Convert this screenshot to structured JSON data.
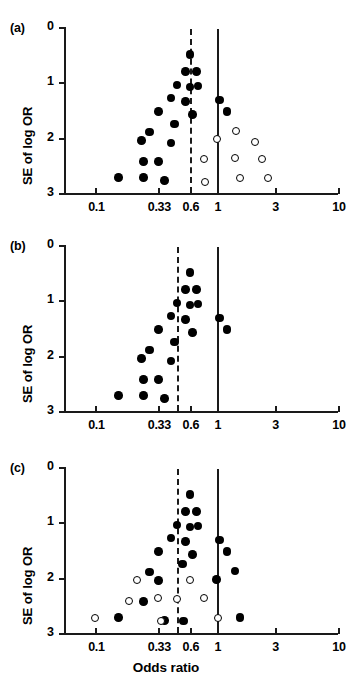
{
  "figure": {
    "xlabel": "Odds ratio",
    "ylabel": "SE of log OR"
  },
  "panels": [
    {
      "letter": "(a)",
      "ylabel": "SE of log OR",
      "xticks": [
        "0.1",
        "0.33",
        "0.6",
        "1",
        "3",
        "10"
      ],
      "yticks": [
        "0",
        "1",
        "2",
        "3"
      ],
      "pooled_line_value": "0.6",
      "null_line_value": "1"
    },
    {
      "letter": "(b)",
      "ylabel": "SE of log OR",
      "xticks": [
        "0.1",
        "0.33",
        "0.6",
        "1",
        "3",
        "10"
      ],
      "yticks": [
        "0",
        "1",
        "2",
        "3"
      ],
      "pooled_line_value": "0.47",
      "null_line_value": "1"
    },
    {
      "letter": "(c)",
      "ylabel": "SE of log OR",
      "xticks": [
        "0.1",
        "0.33",
        "0.6",
        "1",
        "3",
        "10"
      ],
      "yticks": [
        "0",
        "1",
        "2",
        "3"
      ],
      "pooled_line_value": "0.47",
      "null_line_value": "1"
    }
  ],
  "chart_data": [
    {
      "type": "scatter",
      "panel": "(a)",
      "title": "(a)",
      "xlabel": "",
      "ylabel": "SE of log OR",
      "xscale": "log",
      "xlim": [
        0.055,
        10
      ],
      "ylim": [
        0,
        3
      ],
      "y_inverted": true,
      "xticks": [
        0.1,
        0.33,
        0.6,
        1,
        3,
        10
      ],
      "xticklabels": [
        "0.1",
        "0.33",
        "0.6",
        "1",
        "3",
        "10"
      ],
      "yticks": [
        0,
        1,
        2,
        3
      ],
      "yticklabels": [
        "0",
        "1",
        "2",
        "3"
      ],
      "grid": false,
      "legend": null,
      "reference_lines": [
        {
          "name": "pooled-estimate",
          "x": 0.6,
          "style": "dashed"
        },
        {
          "name": "null-effect",
          "x": 1.0,
          "style": "solid"
        }
      ],
      "series": [
        {
          "name": "observed-studies",
          "marker": "filled-circle",
          "color": "#000000",
          "points": [
            {
              "x": 0.6,
              "y": 0.5
            },
            {
              "x": 0.55,
              "y": 0.8
            },
            {
              "x": 0.68,
              "y": 0.8
            },
            {
              "x": 0.47,
              "y": 1.05
            },
            {
              "x": 0.6,
              "y": 1.08
            },
            {
              "x": 0.7,
              "y": 1.07
            },
            {
              "x": 0.42,
              "y": 1.28
            },
            {
              "x": 0.55,
              "y": 1.35
            },
            {
              "x": 1.05,
              "y": 1.32
            },
            {
              "x": 0.33,
              "y": 1.53
            },
            {
              "x": 0.63,
              "y": 1.58
            },
            {
              "x": 1.22,
              "y": 1.53
            },
            {
              "x": 0.28,
              "y": 1.9
            },
            {
              "x": 0.45,
              "y": 1.75
            },
            {
              "x": 0.24,
              "y": 2.05
            },
            {
              "x": 0.42,
              "y": 2.1
            },
            {
              "x": 0.25,
              "y": 2.43
            },
            {
              "x": 0.33,
              "y": 2.43
            },
            {
              "x": 0.155,
              "y": 2.72
            },
            {
              "x": 0.25,
              "y": 2.72
            },
            {
              "x": 0.37,
              "y": 2.77
            }
          ]
        },
        {
          "name": "imputed-studies",
          "marker": "open-circle",
          "color": "#000000",
          "points": [
            {
              "x": 1.45,
              "y": 1.88
            },
            {
              "x": 1.0,
              "y": 2.03
            },
            {
              "x": 2.05,
              "y": 2.07
            },
            {
              "x": 1.42,
              "y": 2.37
            },
            {
              "x": 2.35,
              "y": 2.38
            },
            {
              "x": 0.78,
              "y": 2.38
            },
            {
              "x": 1.55,
              "y": 2.72
            },
            {
              "x": 2.65,
              "y": 2.72
            },
            {
              "x": 0.8,
              "y": 2.8
            }
          ]
        }
      ]
    },
    {
      "type": "scatter",
      "panel": "(b)",
      "title": "(b)",
      "xlabel": "",
      "ylabel": "SE of log OR",
      "xscale": "log",
      "xlim": [
        0.055,
        10
      ],
      "ylim": [
        0,
        3
      ],
      "y_inverted": true,
      "xticks": [
        0.1,
        0.33,
        0.6,
        1,
        3,
        10
      ],
      "xticklabels": [
        "0.1",
        "0.33",
        "0.6",
        "1",
        "3",
        "10"
      ],
      "yticks": [
        0,
        1,
        2,
        3
      ],
      "yticklabels": [
        "0",
        "1",
        "2",
        "3"
      ],
      "grid": false,
      "legend": null,
      "reference_lines": [
        {
          "name": "pooled-estimate",
          "x": 0.47,
          "style": "dashed"
        },
        {
          "name": "null-effect",
          "x": 1.0,
          "style": "solid"
        }
      ],
      "series": [
        {
          "name": "observed-studies",
          "marker": "filled-circle",
          "color": "#000000",
          "points": [
            {
              "x": 0.6,
              "y": 0.5
            },
            {
              "x": 0.55,
              "y": 0.8
            },
            {
              "x": 0.68,
              "y": 0.8
            },
            {
              "x": 0.47,
              "y": 1.05
            },
            {
              "x": 0.6,
              "y": 1.08
            },
            {
              "x": 0.7,
              "y": 1.07
            },
            {
              "x": 0.42,
              "y": 1.28
            },
            {
              "x": 0.55,
              "y": 1.35
            },
            {
              "x": 1.05,
              "y": 1.32
            },
            {
              "x": 0.33,
              "y": 1.53
            },
            {
              "x": 0.63,
              "y": 1.58
            },
            {
              "x": 1.22,
              "y": 1.53
            },
            {
              "x": 0.28,
              "y": 1.9
            },
            {
              "x": 0.45,
              "y": 1.75
            },
            {
              "x": 0.24,
              "y": 2.05
            },
            {
              "x": 0.42,
              "y": 2.1
            },
            {
              "x": 0.25,
              "y": 2.43
            },
            {
              "x": 0.33,
              "y": 2.43
            },
            {
              "x": 0.155,
              "y": 2.72
            },
            {
              "x": 0.25,
              "y": 2.72
            },
            {
              "x": 0.37,
              "y": 2.77
            }
          ]
        }
      ]
    },
    {
      "type": "scatter",
      "panel": "(c)",
      "title": "(c)",
      "xlabel": "Odds ratio",
      "ylabel": "SE of log OR",
      "xscale": "log",
      "xlim": [
        0.055,
        10
      ],
      "ylim": [
        0,
        3
      ],
      "y_inverted": true,
      "xticks": [
        0.1,
        0.33,
        0.6,
        1,
        3,
        10
      ],
      "xticklabels": [
        "0.1",
        "0.33",
        "0.6",
        "1",
        "3",
        "10"
      ],
      "yticks": [
        0,
        1,
        2,
        3
      ],
      "yticklabels": [
        "0",
        "1",
        "2",
        "3"
      ],
      "grid": false,
      "legend": null,
      "reference_lines": [
        {
          "name": "pooled-estimate",
          "x": 0.47,
          "style": "dashed"
        },
        {
          "name": "null-effect",
          "x": 1.0,
          "style": "solid"
        }
      ],
      "series": [
        {
          "name": "observed-studies",
          "marker": "filled-circle",
          "color": "#000000",
          "points": [
            {
              "x": 0.6,
              "y": 0.5
            },
            {
              "x": 0.55,
              "y": 0.8
            },
            {
              "x": 0.68,
              "y": 0.8
            },
            {
              "x": 0.47,
              "y": 1.05
            },
            {
              "x": 0.6,
              "y": 1.08
            },
            {
              "x": 0.7,
              "y": 1.07
            },
            {
              "x": 0.42,
              "y": 1.28
            },
            {
              "x": 0.55,
              "y": 1.35
            },
            {
              "x": 1.05,
              "y": 1.32
            },
            {
              "x": 0.33,
              "y": 1.53
            },
            {
              "x": 0.63,
              "y": 1.58
            },
            {
              "x": 1.22,
              "y": 1.53
            },
            {
              "x": 0.28,
              "y": 1.9
            },
            {
              "x": 0.52,
              "y": 1.75
            },
            {
              "x": 0.33,
              "y": 2.05
            },
            {
              "x": 1.42,
              "y": 1.88
            },
            {
              "x": 1.0,
              "y": 2.03
            },
            {
              "x": 0.25,
              "y": 2.43
            },
            {
              "x": 0.155,
              "y": 2.72
            },
            {
              "x": 0.37,
              "y": 2.77
            },
            {
              "x": 0.53,
              "y": 2.78
            },
            {
              "x": 1.55,
              "y": 2.72
            }
          ]
        },
        {
          "name": "imputed-studies",
          "marker": "open-circle",
          "color": "#000000",
          "points": [
            {
              "x": 0.22,
              "y": 2.05
            },
            {
              "x": 0.19,
              "y": 2.42
            },
            {
              "x": 0.33,
              "y": 2.37
            },
            {
              "x": 0.47,
              "y": 2.38
            },
            {
              "x": 0.6,
              "y": 2.05
            },
            {
              "x": 0.78,
              "y": 2.37
            },
            {
              "x": 0.1,
              "y": 2.72
            },
            {
              "x": 0.345,
              "y": 2.78
            },
            {
              "x": 1.02,
              "y": 2.72
            }
          ]
        }
      ]
    }
  ]
}
